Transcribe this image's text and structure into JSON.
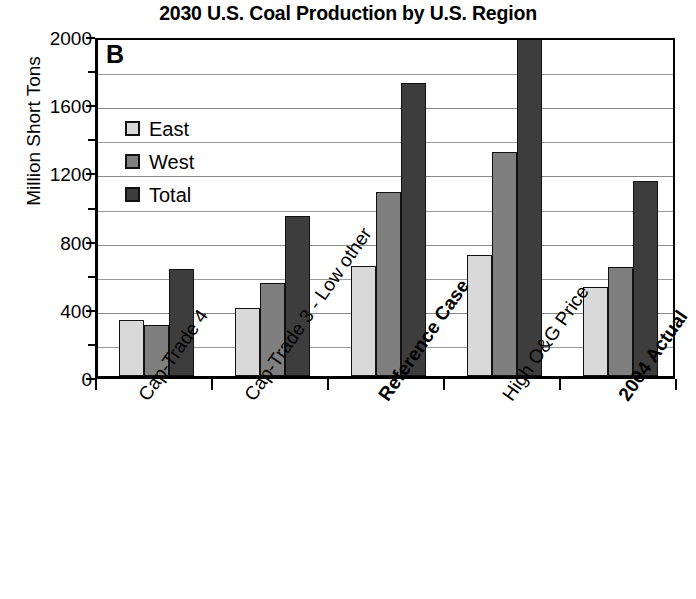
{
  "chart_data": {
    "type": "bar",
    "title": "2030 U.S. Coal Production by U.S. Region",
    "panel_label": "B",
    "xlabel": "",
    "ylabel": "Million Short Tons",
    "ylim": [
      0,
      2000
    ],
    "y_major_ticks": [
      0,
      400,
      800,
      1200,
      1600,
      2000
    ],
    "y_minor_ticks": [
      200,
      600,
      1000,
      1400,
      1800
    ],
    "y_tick_labels": [
      "0",
      "400",
      "800",
      "1200",
      "1600",
      "2000"
    ],
    "grid": true,
    "legend_position": "upper-left-inside",
    "legend": [
      "East",
      "West",
      "Total"
    ],
    "categories": [
      "Cap-Trade 4",
      "Cap-Trade 3 - Low other",
      "Reference Case",
      "High O&G Price",
      "2004 Actual"
    ],
    "categories_bold": [
      false,
      false,
      true,
      false,
      true
    ],
    "series": [
      {
        "name": "East",
        "color": "#d9d9d9",
        "values": [
          330,
          400,
          645,
          710,
          520
        ]
      },
      {
        "name": "West",
        "color": "#7f7f7f",
        "values": [
          300,
          545,
          1080,
          1315,
          640
        ]
      },
      {
        "name": "Total",
        "color": "#3d3d3d",
        "values": [
          630,
          940,
          1720,
          2090,
          1145
        ]
      }
    ]
  }
}
